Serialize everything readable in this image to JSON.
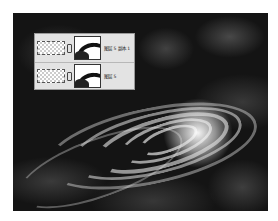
{
  "canvas": {
    "description": "dark nebula background with bright white spiral swirl",
    "background_color": "#141414",
    "swirl_color": "#ebebeb"
  },
  "layers_panel": {
    "layers": [
      {
        "name": "图层 5 副本 1",
        "thumbnail_icon": "transparent-checker-thumbnail",
        "link_icon": "chain-link-icon",
        "mask_icon": "layer-mask-thumbnail"
      },
      {
        "name": "图层 5",
        "thumbnail_icon": "transparent-checker-thumbnail",
        "link_icon": "chain-link-icon",
        "mask_icon": "layer-mask-thumbnail"
      }
    ]
  }
}
